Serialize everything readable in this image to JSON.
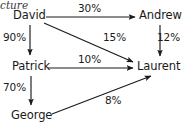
{
  "diagram": {
    "title_fragment": "cture",
    "background_color": "#ffffff",
    "line_color": "#1a1a1a",
    "text_color": "#1a1a1a",
    "type": "directed-graph",
    "nodes": [
      {
        "id": "david",
        "label": "David",
        "x": 30,
        "y": 16
      },
      {
        "id": "andrew",
        "label": "Andrew",
        "x": 160,
        "y": 16
      },
      {
        "id": "patrick",
        "label": "Patrick",
        "x": 30,
        "y": 67
      },
      {
        "id": "laurent",
        "label": "Laurent",
        "x": 158,
        "y": 67
      },
      {
        "id": "george",
        "label": "George",
        "x": 31,
        "y": 116
      }
    ],
    "edges": [
      {
        "id": "david-andrew",
        "from": "David",
        "to": "Andrew",
        "label": "30%",
        "direction": "right"
      },
      {
        "id": "david-patrick",
        "from": "David",
        "to": "Patrick",
        "label": "90%",
        "direction": "down"
      },
      {
        "id": "david-laurent",
        "from": "David",
        "to": "Laurent",
        "label": "15%",
        "direction": "down-right"
      },
      {
        "id": "andrew-laurent",
        "from": "Andrew",
        "to": "Laurent",
        "label": "12%",
        "direction": "down"
      },
      {
        "id": "patrick-laurent",
        "from": "Patrick",
        "to": "Laurent",
        "label": "10%",
        "direction": "right"
      },
      {
        "id": "patrick-george",
        "from": "Patrick",
        "to": "George",
        "label": "70%",
        "direction": "down"
      },
      {
        "id": "george-laurent",
        "from": "George",
        "to": "Laurent",
        "label": "8%",
        "direction": "up-right"
      }
    ]
  }
}
